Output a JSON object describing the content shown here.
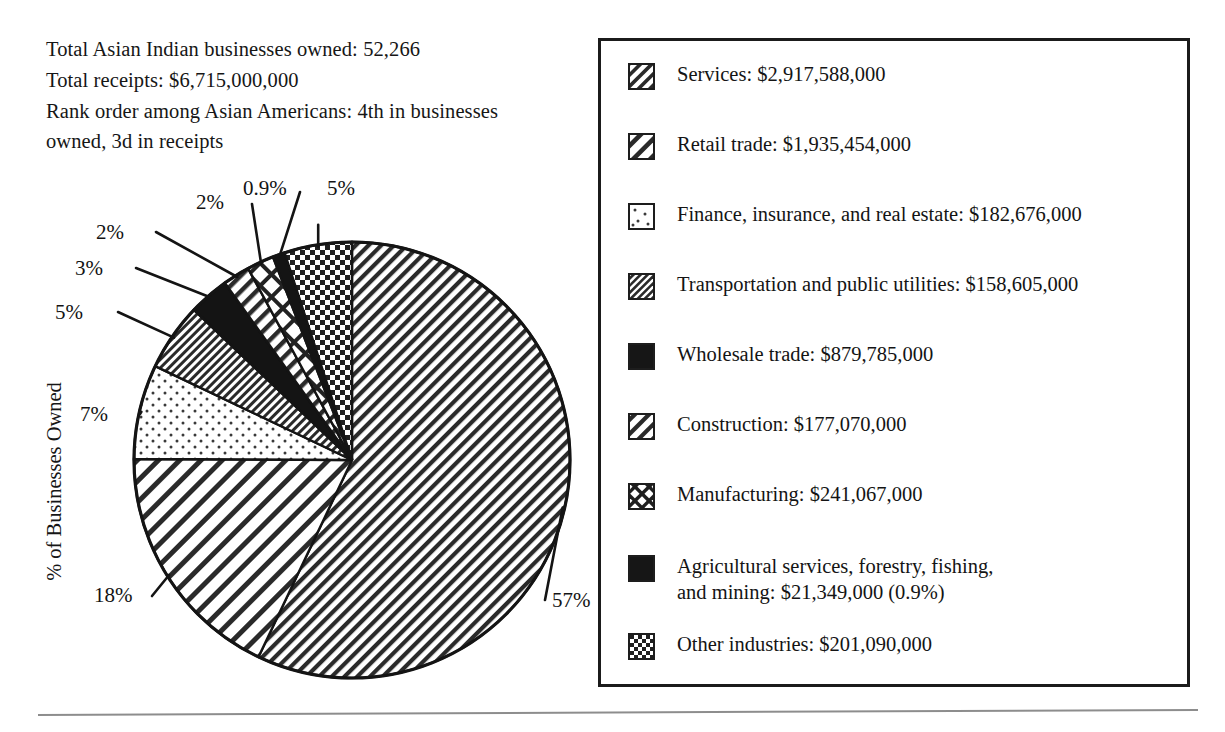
{
  "header": {
    "lines": [
      "Total Asian Indian businesses owned: 52,266",
      "Total receipts: $6,715,000,000",
      "Rank order among Asian Americans: 4th in businesses\nowned, 3d in receipts"
    ]
  },
  "axis": {
    "ylabel": "% of Businesses Owned"
  },
  "chart_data": {
    "type": "pie",
    "title": "",
    "xlabel": "",
    "ylabel": "% of Businesses Owned",
    "legend_position": "right",
    "grid": false,
    "start_angle_deg": 0,
    "direction": "clockwise",
    "units": "percent of businesses owned",
    "categories": [
      "Services",
      "Retail trade",
      "Finance, insurance, and real estate",
      "Transportation and public utilities",
      "Wholesale trade",
      "Construction",
      "Manufacturing",
      "Agricultural services, forestry, fishing, and mining",
      "Other industries"
    ],
    "values": [
      57,
      18,
      7,
      5,
      3,
      2,
      2,
      0.9,
      5
    ],
    "value_labels": [
      "57%",
      "18%",
      "7%",
      "5%",
      "3%",
      "2%",
      "2%",
      "0.9%",
      "5%"
    ],
    "receipts": [
      "$2,917,588,000",
      "$1,935,454,000",
      "$182,676,000",
      "$158,605,000",
      "$879,785,000",
      "$177,070,000",
      "$241,067,000",
      "$21,349,000",
      "$201,090,000"
    ],
    "patterns": [
      "diagonal-hatch-fine",
      "diagonal-hatch-wide",
      "dots-sparse",
      "diagonal-hatch-dense",
      "solid-black",
      "diagonal-hatch-medium",
      "crosshatch",
      "solid-black",
      "checkerboard"
    ]
  },
  "pie_labels": [
    {
      "text": "5%",
      "left": 55,
      "top": 300
    },
    {
      "text": "3%",
      "left": 75,
      "top": 256
    },
    {
      "text": "2%",
      "left": 96,
      "top": 220
    },
    {
      "text": "2%",
      "left": 196,
      "top": 190
    },
    {
      "text": "0.9%",
      "left": 243,
      "top": 176
    },
    {
      "text": "5%",
      "left": 327,
      "top": 176
    },
    {
      "text": "7%",
      "left": 80,
      "top": 402
    },
    {
      "text": "18%",
      "left": 94,
      "top": 583
    },
    {
      "text": "57%",
      "left": 552,
      "top": 588
    }
  ],
  "legend": {
    "items": [
      {
        "label": "Services: $2,917,588,000",
        "pattern": "diagonal-hatch-fine"
      },
      {
        "label": "Retail trade: $1,935,454,000",
        "pattern": "diagonal-hatch-wide"
      },
      {
        "label": "Finance, insurance, and real estate: $182,676,000",
        "pattern": "dots-sparse"
      },
      {
        "label": "Transportation and public utilities: $158,605,000",
        "pattern": "diagonal-hatch-dense"
      },
      {
        "label": "Wholesale trade: $879,785,000",
        "pattern": "solid-black"
      },
      {
        "label": "Construction: $177,070,000",
        "pattern": "diagonal-hatch-medium"
      },
      {
        "label": "Manufacturing: $241,067,000",
        "pattern": "crosshatch"
      },
      {
        "label": "Agricultural services, forestry, fishing,\nand mining: $21,349,000 (0.9%)",
        "pattern": "solid-black"
      },
      {
        "label": "Other industries: $201,090,000",
        "pattern": "checkerboard"
      }
    ]
  },
  "colors": {
    "ink": "#141414",
    "rule": "#8d8d8d",
    "paper": "#ffffff"
  }
}
